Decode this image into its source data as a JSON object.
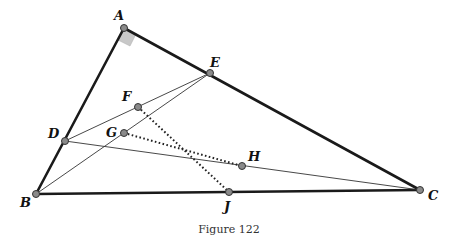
{
  "figure": {
    "caption": "Figure 122",
    "points": {
      "A": {
        "label": "A",
        "x": 124,
        "y": 28
      },
      "B": {
        "label": "B",
        "x": 36,
        "y": 194
      },
      "C": {
        "label": "C",
        "x": 420,
        "y": 190
      },
      "D": {
        "label": "D",
        "x": 65,
        "y": 141
      },
      "E": {
        "label": "E",
        "x": 210,
        "y": 73
      },
      "F": {
        "label": "F",
        "x": 138,
        "y": 107
      },
      "G": {
        "label": "G",
        "x": 124,
        "y": 133
      },
      "H": {
        "label": "H",
        "x": 242,
        "y": 166
      },
      "J": {
        "label": "J",
        "x": 229,
        "y": 192
      }
    },
    "segments": {
      "thick": [
        "AB",
        "AC",
        "BC"
      ],
      "thin": [
        "DE",
        "BE",
        "DC"
      ],
      "dotted": [
        "FJ",
        "GH"
      ]
    },
    "right_angle_at": "A"
  }
}
